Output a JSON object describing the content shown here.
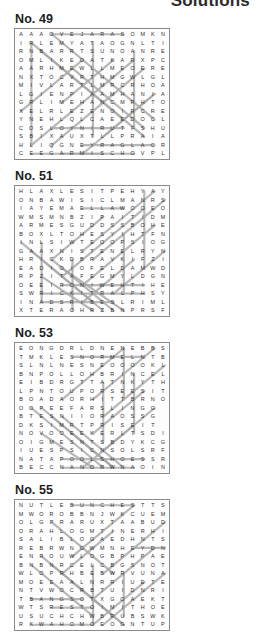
{
  "header": {
    "title": "Solutions"
  },
  "puzzles": [
    {
      "label": "No. 49",
      "size": 15,
      "rows": [
        "AAAOVEJARASOMKN",
        "IRLEMYATAOGNLTI",
        "RNBARRTSUNOANRE",
        "OMLIKEOATKARXPC",
        "AARHMEWLLMEOERE",
        "NXTOCVRTHMGWLGL",
        "MIVLARTLMRCRHOA",
        "LGIENPIAAMHANIA",
        "GRLIMEHANCMRHTO",
        "XELRLEZENOIRCRE",
        "YNEHLQLCAEEDOCL",
        "COSLOYNIRUTFSHU",
        "SBIXAUXTLLPRAIA",
        "HLIQGNEYRAGLACR",
        "CEEGARMISCHOVPL"
      ],
      "solution_lines": [
        {
          "x1": 3,
          "y1": 0,
          "x2": 10,
          "y2": 0
        },
        {
          "x1": 1,
          "y1": 14,
          "x2": 8,
          "y2": 14
        },
        {
          "x1": 4,
          "y1": 14,
          "x2": 11,
          "y2": 14
        },
        {
          "x1": 6,
          "y1": 13,
          "x2": 13,
          "y2": 13
        },
        {
          "x1": 3,
          "y1": 11,
          "x2": 10,
          "y2": 11
        },
        {
          "x1": 1,
          "y1": 1,
          "x2": 1,
          "y2": 13
        },
        {
          "x1": 7,
          "y1": 1,
          "x2": 7,
          "y2": 12
        },
        {
          "x1": 11,
          "y1": 2,
          "x2": 11,
          "y2": 11
        },
        {
          "x1": 1,
          "y1": 1,
          "x2": 12,
          "y2": 12
        },
        {
          "x1": 2,
          "y1": 2,
          "x2": 10,
          "y2": 10
        },
        {
          "x1": 3,
          "y1": 0,
          "x2": 13,
          "y2": 10
        },
        {
          "x1": 5,
          "y1": 4,
          "x2": 12,
          "y2": 11
        },
        {
          "x1": 0,
          "y1": 9,
          "x2": 6,
          "y2": 3
        },
        {
          "x1": 1,
          "y1": 13,
          "x2": 11,
          "y2": 3
        },
        {
          "x1": 3,
          "y1": 13,
          "x2": 12,
          "y2": 4
        },
        {
          "x1": 6,
          "y1": 14,
          "x2": 13,
          "y2": 7
        },
        {
          "x1": 8,
          "y1": 12,
          "x2": 13,
          "y2": 7
        },
        {
          "x1": 4,
          "y1": 8,
          "x2": 9,
          "y2": 3
        }
      ]
    },
    {
      "label": "No. 51",
      "size": 15,
      "rows": [
        "HLAXLESITPEHYAY",
        "ONBAWISICLMANRS",
        "IAYEMAELLAWOOEO",
        "WMSMNBZIPAITIDM",
        "ARMESGUDDSSBOHE",
        "BOXLTOHESYIHTFN",
        "INLSIWTEOOPSIOG",
        "GAAXNISTENELRYN",
        "HRICKDBRAVKIFZI",
        "EADIOIOFELDAMWD",
        "RPZITAFEGMYLDGN",
        "OEEIRONIWEHTIHE",
        "SWRICKITRALPHSY",
        "INADSRIBESLRIML",
        "XTERAOHRZBNPRSF"
      ],
      "solution_lines": [
        {
          "x1": 4,
          "y1": 11,
          "x2": 12,
          "y2": 11
        },
        {
          "x1": 2,
          "y1": 12,
          "x2": 12,
          "y2": 12
        },
        {
          "x1": 6,
          "y1": 2,
          "x2": 10,
          "y2": 2
        },
        {
          "x1": 2,
          "y1": 13,
          "x2": 9,
          "y2": 13
        },
        {
          "x1": 2,
          "y1": 6,
          "x2": 2,
          "y2": 13
        },
        {
          "x1": 10,
          "y1": 5,
          "x2": 10,
          "y2": 12
        },
        {
          "x1": 12,
          "y1": 0,
          "x2": 12,
          "y2": 9
        },
        {
          "x1": 5,
          "y1": 8,
          "x2": 5,
          "y2": 14
        },
        {
          "x1": 0,
          "y1": 6,
          "x2": 7,
          "y2": 13
        },
        {
          "x1": 1,
          "y1": 7,
          "x2": 8,
          "y2": 14
        },
        {
          "x1": 3,
          "y1": 8,
          "x2": 9,
          "y2": 14
        },
        {
          "x1": 4,
          "y1": 9,
          "x2": 10,
          "y2": 14
        },
        {
          "x1": 2,
          "y1": 10,
          "x2": 7,
          "y2": 14
        },
        {
          "x1": 13,
          "y1": 0,
          "x2": 6,
          "y2": 7
        },
        {
          "x1": 14,
          "y1": 1,
          "x2": 7,
          "y2": 8
        },
        {
          "x1": 12,
          "y1": 2,
          "x2": 4,
          "y2": 10
        },
        {
          "x1": 13,
          "y1": 4,
          "x2": 6,
          "y2": 11
        },
        {
          "x1": 14,
          "y1": 7,
          "x2": 9,
          "y2": 12
        },
        {
          "x1": 11,
          "y1": 8,
          "x2": 6,
          "y2": 13
        },
        {
          "x1": 8,
          "y1": 3,
          "x2": 3,
          "y2": 8
        }
      ]
    },
    {
      "label": "No. 53",
      "size": 15,
      "rows": [
        "EONGDRLDNENEBBS",
        "TMKLESNORMELNTB",
        "SLNLNESNEOOOOKL",
        "BNPOLLOHBRINCEL",
        "EIBDRGTTATNKYTH",
        "LPNTOUPORSEESIT",
        "BOADAORHITTBRNO",
        "OOPEEFARSLINGG",
        "BTESNIIORAOSSG",
        "DKSIMRTPRISEIT",
        "NOVOOEEKERLTSDI",
        "OIGMESNTSBDYKCG",
        "IUESPSICNSOLSRF",
        "NATAPOOLSHOESSR",
        "BECCNANORWNAOIN"
      ],
      "solution_lines": [
        {
          "x1": 5,
          "y1": 1,
          "x2": 12,
          "y2": 1
        },
        {
          "x1": 4,
          "y1": 13,
          "x2": 12,
          "y2": 13
        },
        {
          "x1": 4,
          "y1": 14,
          "x2": 11,
          "y2": 14
        },
        {
          "x1": 10,
          "y1": 0,
          "x2": 10,
          "y2": 6
        },
        {
          "x1": 8,
          "y1": 4,
          "x2": 8,
          "y2": 11
        },
        {
          "x1": 11,
          "y1": 3,
          "x2": 11,
          "y2": 10
        },
        {
          "x1": 1,
          "y1": 7,
          "x2": 8,
          "y2": 14
        },
        {
          "x1": 2,
          "y1": 7,
          "x2": 9,
          "y2": 14
        },
        {
          "x1": 3,
          "y1": 8,
          "x2": 9,
          "y2": 14
        },
        {
          "x1": 4,
          "y1": 8,
          "x2": 10,
          "y2": 14
        },
        {
          "x1": 2,
          "y1": 10,
          "x2": 7,
          "y2": 14
        },
        {
          "x1": 5,
          "y1": 10,
          "x2": 9,
          "y2": 14
        },
        {
          "x1": 10,
          "y1": 0,
          "x2": 4,
          "y2": 6
        },
        {
          "x1": 13,
          "y1": 0,
          "x2": 7,
          "y2": 6
        },
        {
          "x1": 14,
          "y1": 2,
          "x2": 8,
          "y2": 8
        },
        {
          "x1": 12,
          "y1": 5,
          "x2": 7,
          "y2": 10
        },
        {
          "x1": 13,
          "y1": 7,
          "x2": 8,
          "y2": 12
        },
        {
          "x1": 11,
          "y1": 9,
          "x2": 6,
          "y2": 14
        }
      ]
    },
    {
      "label": "No. 55",
      "size": 15,
      "rows": [
        "NUTLEBUNCHESTTS",
        "MWOROBBNJWKCUEM",
        "OLGPRARUXTAABUD",
        "ORAHLOGMTINERHI",
        "SALIBLOGAEDHNTS",
        "REBRWNGWMNHEYDN",
        "ENROUWLOGBPHPAE",
        "BNBNRCELCBGSNOT",
        "WLOPRHBEBWRVUNA",
        "MOEEAALNRRIUETE",
        "NTVWOCRBTUIDNRI",
        "TBANGSOTXGOAEKT",
        "WTSRESTOIMITHOE",
        "USUCHCHWBRUBSWK",
        "RKWAHOMOEOGNTUP"
      ],
      "solution_lines": [
        {
          "x1": 5,
          "y1": 0,
          "x2": 11,
          "y2": 0
        },
        {
          "x1": 11,
          "y1": 5,
          "x2": 14,
          "y2": 5
        },
        {
          "x1": 1,
          "y1": 11,
          "x2": 6,
          "y2": 11
        },
        {
          "x1": 3,
          "y1": 12,
          "x2": 7,
          "y2": 12
        },
        {
          "x1": 1,
          "y1": 14,
          "x2": 7,
          "y2": 14
        },
        {
          "x1": 7,
          "y1": 7,
          "x2": 7,
          "y2": 14
        },
        {
          "x1": 10,
          "y1": 8,
          "x2": 10,
          "y2": 13
        },
        {
          "x1": 2,
          "y1": 6,
          "x2": 9,
          "y2": 13
        },
        {
          "x1": 3,
          "y1": 7,
          "x2": 10,
          "y2": 14
        },
        {
          "x1": 1,
          "y1": 7,
          "x2": 7,
          "y2": 13
        },
        {
          "x1": 5,
          "y1": 9,
          "x2": 10,
          "y2": 14
        },
        {
          "x1": 3,
          "y1": 2,
          "x2": 9,
          "y2": 8
        },
        {
          "x1": 11,
          "y1": 0,
          "x2": 5,
          "y2": 6
        },
        {
          "x1": 14,
          "y1": 2,
          "x2": 8,
          "y2": 8
        },
        {
          "x1": 13,
          "y1": 5,
          "x2": 7,
          "y2": 11
        },
        {
          "x1": 14,
          "y1": 8,
          "x2": 8,
          "y2": 14
        },
        {
          "x1": 12,
          "y1": 9,
          "x2": 7,
          "y2": 14
        },
        {
          "x1": 9,
          "y1": 3,
          "x2": 4,
          "y2": 8
        }
      ]
    }
  ]
}
